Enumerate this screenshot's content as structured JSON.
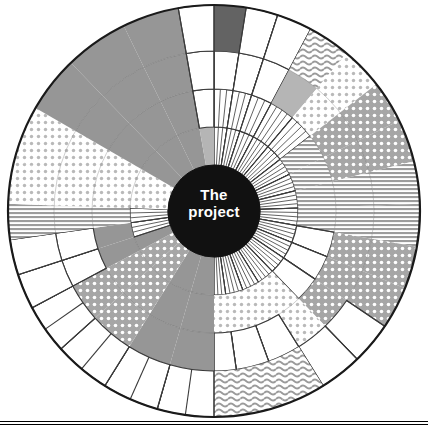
{
  "diagram": {
    "type": "sunburst-wheel",
    "title_center_line1": "The",
    "title_center_line2": "project",
    "center_fill": "#111111",
    "center_text_color": "#ffffff",
    "outline_color": "#1a1a1a",
    "background": "#ffffff",
    "geometry": {
      "cx": 214,
      "cy": 211,
      "outer_radius": 206,
      "ring_radii": [
        46,
        84,
        122,
        160,
        206
      ],
      "ring_count": 4,
      "rotation_deg": -90
    },
    "palette": {
      "dark_gray": "#636363",
      "mid_gray": "#969696",
      "light_gray": "#b5b5b5",
      "pale_gray": "#d0d0d0",
      "white": "#ffffff",
      "line": "#3a3a3a"
    },
    "fill_kinds": [
      "solid-dark",
      "solid-mid",
      "solid-light",
      "solid-pale",
      "dots-light",
      "dots-mid",
      "waves",
      "hlines",
      "vlines",
      "white-cells"
    ],
    "footer_rules": 2,
    "sectors": [
      {
        "name": "sector-n-1",
        "start": 0,
        "end": 9,
        "rings": [
          "vlines",
          "vlines",
          "white-cells",
          "solid-dark"
        ]
      },
      {
        "name": "sector-n-2",
        "start": 9,
        "end": 18,
        "rings": [
          "vlines",
          "vlines",
          "white-cells",
          "white-cells"
        ]
      },
      {
        "name": "sector-n-3",
        "start": 18,
        "end": 28,
        "rings": [
          "vlines",
          "vlines",
          "white-cells",
          "white-cells"
        ]
      },
      {
        "name": "sector-nw-1",
        "start": 28,
        "end": 40,
        "rings": [
          "vlines",
          "vlines",
          "solid-light",
          "waves"
        ]
      },
      {
        "name": "sector-nw-2",
        "start": 40,
        "end": 52,
        "rings": [
          "vlines",
          "vlines",
          "dots-light",
          "dots-light"
        ]
      },
      {
        "name": "sector-nw-3",
        "start": 52,
        "end": 64,
        "rings": [
          "vlines",
          "hlines",
          "dots-mid",
          "dots-mid"
        ]
      },
      {
        "name": "sector-w-1",
        "start": 64,
        "end": 76,
        "rings": [
          "vlines",
          "hlines",
          "dots-mid",
          "dots-mid"
        ]
      },
      {
        "name": "sector-w-2",
        "start": 76,
        "end": 88,
        "rings": [
          "vlines",
          "hlines",
          "hlines",
          "hlines"
        ]
      },
      {
        "name": "sector-w-3",
        "start": 88,
        "end": 100,
        "rings": [
          "vlines",
          "hlines",
          "hlines",
          "hlines"
        ]
      },
      {
        "name": "sector-sw-1",
        "start": 100,
        "end": 112,
        "rings": [
          "vlines",
          "white-cells",
          "dots-mid",
          "dots-mid"
        ]
      },
      {
        "name": "sector-sw-2",
        "start": 112,
        "end": 124,
        "rings": [
          "vlines",
          "white-cells",
          "dots-mid",
          "dots-mid"
        ]
      },
      {
        "name": "sector-sw-3",
        "start": 124,
        "end": 136,
        "rings": [
          "vlines",
          "white-cells",
          "dots-mid",
          "white-cells"
        ]
      },
      {
        "name": "sector-s-1",
        "start": 136,
        "end": 148,
        "rings": [
          "vlines",
          "dots-light",
          "dots-light",
          "white-cells"
        ]
      },
      {
        "name": "sector-s-2",
        "start": 148,
        "end": 160,
        "rings": [
          "vlines",
          "dots-light",
          "white-cells",
          "waves"
        ]
      },
      {
        "name": "sector-s-3",
        "start": 160,
        "end": 172,
        "rings": [
          "vlines",
          "dots-light",
          "white-cells",
          "waves"
        ]
      },
      {
        "name": "sector-s-4",
        "start": 172,
        "end": 180,
        "rings": [
          "vlines",
          "dots-light",
          "white-cells",
          "waves"
        ]
      },
      {
        "name": "sector-se-1",
        "start": 180,
        "end": 196,
        "rings": [
          "solid-mid",
          "solid-mid",
          "solid-mid",
          "white-cells"
        ]
      },
      {
        "name": "sector-se-2",
        "start": 196,
        "end": 212,
        "rings": [
          "solid-mid",
          "solid-mid",
          "solid-mid",
          "white-cells"
        ]
      },
      {
        "name": "sector-se-3",
        "start": 212,
        "end": 228,
        "rings": [
          "dots-mid",
          "dots-mid",
          "dots-mid",
          "white-cells"
        ]
      },
      {
        "name": "sector-e-1",
        "start": 228,
        "end": 242,
        "rings": [
          "dots-mid",
          "dots-mid",
          "dots-mid",
          "white-cells"
        ]
      },
      {
        "name": "sector-e-2",
        "start": 242,
        "end": 252,
        "rings": [
          "solid-mid",
          "solid-mid",
          "white-cells",
          "white-cells"
        ]
      },
      {
        "name": "sector-e-3",
        "start": 252,
        "end": 262,
        "rings": [
          "vlines",
          "solid-mid",
          "white-cells",
          "white-cells"
        ]
      },
      {
        "name": "sector-ne-1",
        "start": 262,
        "end": 272,
        "rings": [
          "vlines",
          "hlines",
          "hlines",
          "hlines"
        ]
      },
      {
        "name": "sector-ne-2",
        "start": 272,
        "end": 284,
        "rings": [
          "dots-light",
          "dots-light",
          "dots-light",
          "dots-light"
        ]
      },
      {
        "name": "sector-ne-3",
        "start": 284,
        "end": 300,
        "rings": [
          "dots-light",
          "dots-light",
          "dots-light",
          "dots-light"
        ]
      },
      {
        "name": "sector-ne-4",
        "start": 300,
        "end": 316,
        "rings": [
          "solid-mid",
          "solid-mid",
          "solid-mid",
          "solid-mid"
        ]
      },
      {
        "name": "sector-ne-5",
        "start": 316,
        "end": 334,
        "rings": [
          "solid-mid",
          "solid-mid",
          "solid-mid",
          "solid-mid"
        ]
      },
      {
        "name": "sector-n-0",
        "start": 334,
        "end": 350,
        "rings": [
          "solid-mid",
          "solid-mid",
          "solid-mid",
          "solid-mid"
        ]
      },
      {
        "name": "sector-n-00",
        "start": 350,
        "end": 360,
        "rings": [
          "solid-light",
          "white-cells",
          "white-cells",
          "white-cells"
        ]
      }
    ]
  }
}
